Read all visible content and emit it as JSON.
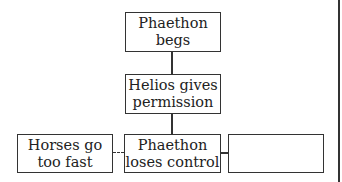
{
  "diagram": {
    "boxes": [
      {
        "id": "top",
        "text": "Phaethon begs"
      },
      {
        "id": "middle",
        "text": "Helios gives permission"
      },
      {
        "id": "bottom_left",
        "text": "Horses go too fast"
      },
      {
        "id": "bottom_center",
        "text": "Phaethon loses control"
      },
      {
        "id": "bottom_right",
        "text": ""
      }
    ]
  }
}
